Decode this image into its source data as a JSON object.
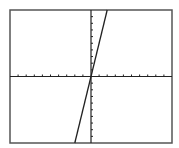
{
  "chart_data": {
    "type": "line",
    "title": "",
    "xlabel": "",
    "ylabel": "",
    "xlim": [
      -10,
      10
    ],
    "ylim": [
      -10,
      10
    ],
    "x_ticks_step": 1,
    "y_ticks_step": 1,
    "grid": false,
    "legend": null,
    "series": [
      {
        "name": "y = 5x",
        "x": [
          -2,
          2
        ],
        "y": [
          -10,
          10
        ]
      }
    ]
  },
  "frame": {
    "left": 10,
    "top": 10,
    "right": 172,
    "bottom": 143
  },
  "colors": {
    "line": "#222222",
    "axis": "#222222",
    "frame": "#555555",
    "background": "#ffffff"
  }
}
